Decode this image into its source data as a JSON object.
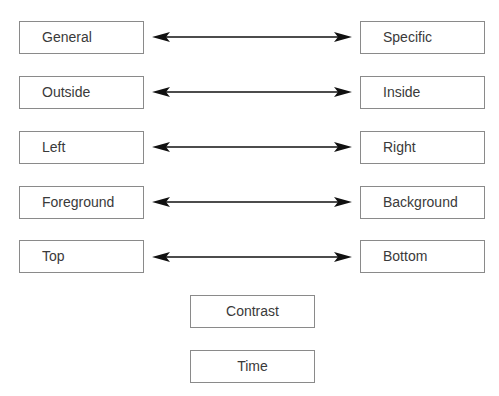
{
  "diagram": {
    "pairs": [
      {
        "left": "General",
        "right": "Specific"
      },
      {
        "left": "Outside",
        "right": "Inside"
      },
      {
        "left": "Left",
        "right": "Right"
      },
      {
        "left": "Foreground",
        "right": "Background"
      },
      {
        "left": "Top",
        "right": "Bottom"
      }
    ],
    "bottom_boxes": [
      "Contrast",
      "Time"
    ],
    "colors": {
      "border": "#8a8a8a",
      "arrow": "#111111",
      "text": "#3a3a3a"
    }
  }
}
